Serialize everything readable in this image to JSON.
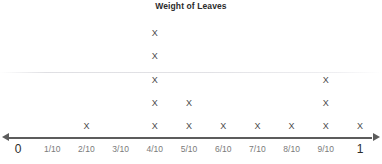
{
  "chart_data": {
    "type": "scatter",
    "plot_style": "dot-plot",
    "title": "Weight of Leaves",
    "xlabel": "",
    "ylabel": "",
    "categories": [
      "0",
      "1/10",
      "2/10",
      "3/10",
      "4/10",
      "5/10",
      "6/10",
      "7/10",
      "8/10",
      "9/10",
      "1"
    ],
    "x": [
      0,
      0.1,
      0.2,
      0.3,
      0.4,
      0.5,
      0.6,
      0.7,
      0.8,
      0.9,
      1
    ],
    "values": [
      0,
      0,
      1,
      0,
      5,
      2,
      1,
      1,
      1,
      3,
      1
    ],
    "marker": "X",
    "xlim": [
      0,
      1
    ],
    "ylim": [
      0,
      5
    ],
    "grid": false,
    "legend": false,
    "axis_arrows": "both"
  },
  "chart": {
    "title": "Weight of Leaves",
    "marker_glyph": "X",
    "axis_ticks": [
      {
        "label": "0",
        "value": 0,
        "count": 0,
        "endpoint": true
      },
      {
        "label": "1/10",
        "value": 0.1,
        "count": 0,
        "endpoint": false
      },
      {
        "label": "2/10",
        "value": 0.2,
        "count": 1,
        "endpoint": false
      },
      {
        "label": "3/10",
        "value": 0.3,
        "count": 0,
        "endpoint": false
      },
      {
        "label": "4/10",
        "value": 0.4,
        "count": 5,
        "endpoint": false
      },
      {
        "label": "5/10",
        "value": 0.5,
        "count": 2,
        "endpoint": false
      },
      {
        "label": "6/10",
        "value": 0.6,
        "count": 1,
        "endpoint": false
      },
      {
        "label": "7/10",
        "value": 0.7,
        "count": 1,
        "endpoint": false
      },
      {
        "label": "8/10",
        "value": 0.8,
        "count": 1,
        "endpoint": false
      },
      {
        "label": "9/10",
        "value": 0.9,
        "count": 3,
        "endpoint": false
      },
      {
        "label": "1",
        "value": 1,
        "count": 1,
        "endpoint": true
      }
    ],
    "colors": {
      "title_text": "#2b2b2b",
      "marker": "#4a4a4a",
      "axis_line": "#5c5c5c",
      "tick_label": "#7a7a7a",
      "endpoint_label": "#2b2b2b",
      "background": "#ffffff"
    }
  }
}
